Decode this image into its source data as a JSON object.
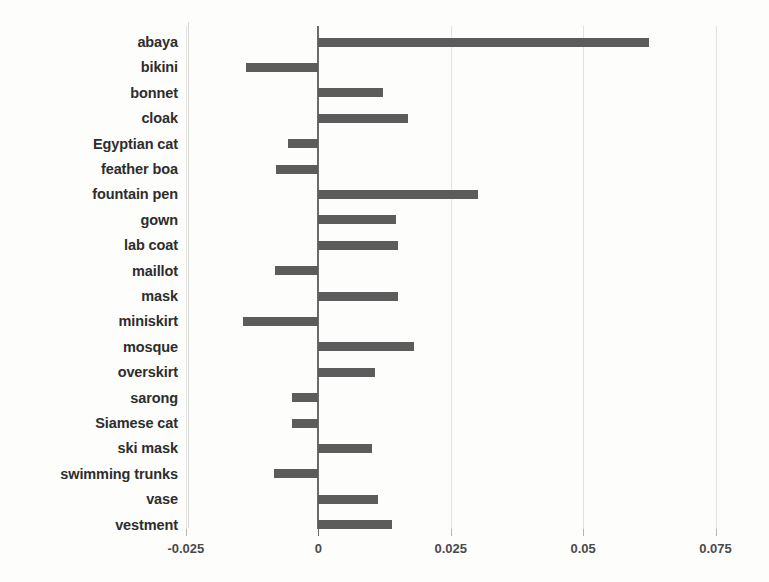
{
  "chart_data": {
    "type": "bar",
    "orientation": "horizontal",
    "title": "",
    "subtitle": "",
    "xlabel": "",
    "ylabel": "",
    "xlim": [
      -0.03,
      0.0775
    ],
    "grid": true,
    "legend": false,
    "bar_color": "#5c5c5c",
    "background_color": "#fdfdfb",
    "gridline_color": "#e2e2de",
    "zero_line_color": "#6b6b6b",
    "xticks": [
      -0.025,
      0,
      0.025,
      0.05,
      0.075
    ],
    "xtick_labels": [
      "-0.025",
      "0",
      "0.025",
      "0.05",
      "0.075"
    ],
    "categories": [
      "abaya",
      "bikini",
      "bonnet",
      "cloak",
      "Egyptian cat",
      "feather boa",
      "fountain pen",
      "gown",
      "lab coat",
      "maillot",
      "mask",
      "miniskirt",
      "mosque",
      "overskirt",
      "sarong",
      "Siamese cat",
      "ski mask",
      "swimming trunks",
      "vase",
      "vestment"
    ],
    "values": [
      0.0625,
      -0.0137,
      0.0123,
      0.017,
      -0.0057,
      -0.0079,
      0.0301,
      0.0147,
      0.0151,
      -0.0082,
      0.015,
      -0.0142,
      0.0181,
      0.0107,
      -0.005,
      -0.005,
      0.0102,
      -0.0084,
      0.0113,
      0.014
    ]
  }
}
